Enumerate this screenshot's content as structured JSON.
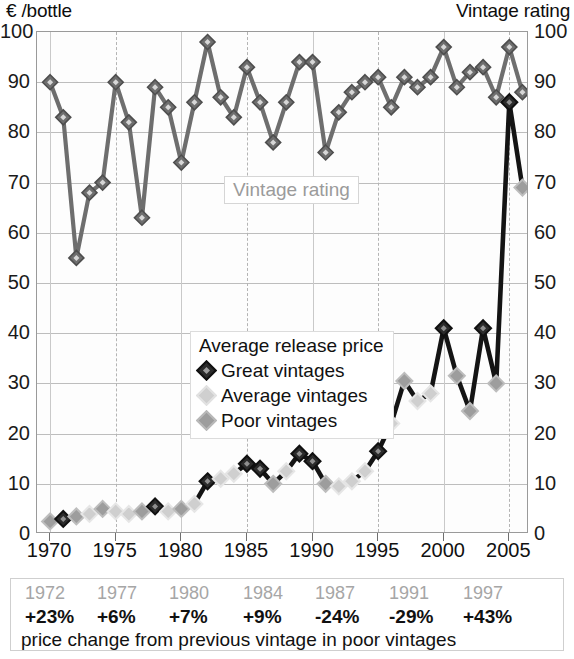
{
  "axes": {
    "left_title": "€ /bottle",
    "right_title": "Vintage rating",
    "y_ticks": [
      0,
      10,
      20,
      30,
      40,
      50,
      60,
      70,
      80,
      90,
      100
    ],
    "x_ticks": [
      1970,
      1975,
      1980,
      1985,
      1990,
      1995,
      2000,
      2005
    ]
  },
  "annotations": {
    "rating_label": "Vintage rating"
  },
  "legend": {
    "title": "Average release price",
    "items": [
      {
        "label": "Great vintages",
        "key": "great",
        "color": "#2b2b2b"
      },
      {
        "label": "Average vintages",
        "key": "average",
        "color": "#cfcfcf"
      },
      {
        "label": "Poor vintages",
        "key": "poor",
        "color": "#9d9d9d"
      }
    ]
  },
  "table": {
    "years": [
      "1972",
      "1977",
      "1980",
      "1984",
      "1987",
      "1991",
      "1997"
    ],
    "changes": [
      "+23%",
      "+6%",
      "+7%",
      "+9%",
      "-24%",
      "-29%",
      "+43%"
    ],
    "caption": "price change from previous vintage in poor vintages"
  },
  "chart_data": {
    "type": "line",
    "title": "",
    "xlabel": "",
    "ylabel": "€ /bottle",
    "y2label": "Vintage rating",
    "xlim": [
      1969,
      2006.5
    ],
    "ylim": [
      0,
      100
    ],
    "y2lim": [
      0,
      100
    ],
    "grid": true,
    "legend_position": "center",
    "x": [
      1970,
      1971,
      1972,
      1973,
      1974,
      1975,
      1976,
      1977,
      1978,
      1979,
      1980,
      1981,
      1982,
      1983,
      1984,
      1985,
      1986,
      1987,
      1988,
      1989,
      1990,
      1991,
      1992,
      1993,
      1994,
      1995,
      1996,
      1997,
      1998,
      1999,
      2000,
      2001,
      2002,
      2003,
      2004,
      2005,
      2006
    ],
    "series": [
      {
        "name": "Vintage rating",
        "axis": "right",
        "color": "#6e6e6e",
        "marker": "diamond",
        "values": [
          90,
          83,
          55,
          68,
          70,
          90,
          82,
          63,
          89,
          85,
          74,
          86,
          98,
          87,
          83,
          93,
          86,
          78,
          86,
          94,
          94,
          76,
          84,
          88,
          90,
          91,
          85,
          91,
          89,
          91,
          97,
          89,
          92,
          93,
          87,
          97,
          88
        ]
      },
      {
        "name": "Average release price",
        "axis": "left",
        "color": "#141414",
        "marker": "diamond",
        "values": [
          2.5,
          3,
          3.5,
          4,
          5,
          4.5,
          4,
          4.5,
          5.5,
          4.5,
          5,
          6,
          10.5,
          11,
          12,
          14,
          13,
          10,
          12.5,
          16,
          14.5,
          10,
          9.5,
          10.5,
          12.5,
          16.5,
          22,
          30.5,
          26.5,
          28,
          41,
          31.5,
          24.5,
          41,
          30,
          86,
          69
        ],
        "classes": [
          "poor",
          "great",
          "poor",
          "average",
          "poor",
          "average",
          "average",
          "poor",
          "great",
          "average",
          "poor",
          "average",
          "great",
          "average",
          "average",
          "great",
          "great",
          "poor",
          "average",
          "great",
          "great",
          "poor",
          "average",
          "average",
          "average",
          "great",
          "average",
          "poor",
          "average",
          "average",
          "great",
          "poor",
          "poor",
          "great",
          "poor",
          "great",
          "poor"
        ]
      }
    ]
  }
}
